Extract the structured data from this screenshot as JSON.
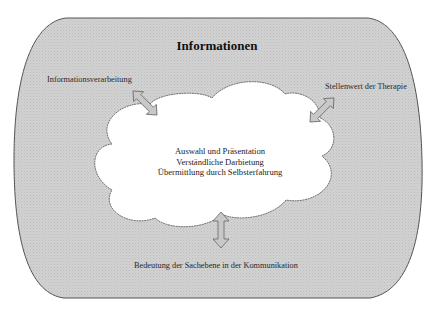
{
  "diagram": {
    "title": "Informationen",
    "corner_labels": {
      "top_left": "Informationsverarbeitung",
      "top_right": "Stellenwert der Therapie",
      "bottom": "Bedeutung der Sachebene in der Kommunikation"
    },
    "cloud_lines": [
      "Auswahl und Präsentation",
      "Verständliche Darbietung",
      "Übermittlung durch Selbsterfahrung"
    ],
    "arrows": [
      {
        "name": "arrow-informationsverarbeitung",
        "type": "double-headed",
        "direction": "diagonal"
      },
      {
        "name": "arrow-stellenwert",
        "type": "double-headed",
        "direction": "diagonal"
      },
      {
        "name": "arrow-sachebene",
        "type": "double-headed",
        "direction": "vertical"
      }
    ],
    "colors": {
      "outer_fill": "#cfcfcf",
      "outer_stroke": "#555555",
      "cloud_fill": "#ffffff",
      "cloud_stroke": "#666666",
      "arrow_fill": "#c8c8c8",
      "text": "#222222"
    }
  }
}
